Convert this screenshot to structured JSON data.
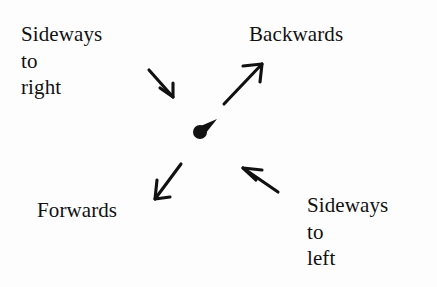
{
  "figure": {
    "caption_present": false,
    "background_color": "#fdfdfd",
    "ink_color": "#111111",
    "labels": {
      "top_left": "Sideways\nto\nright",
      "top_right": "Backwards",
      "bottom_left": "Forwards",
      "bottom_right": "Sideways\nto\nleft"
    },
    "center_marker": {
      "name": "center-dot-marker",
      "dot_x": 200,
      "dot_y": 132,
      "dot_radius": 7,
      "tail_end_x": 217,
      "tail_end_y": 119
    },
    "arrows": [
      {
        "name": "arrow-sideways-to-right",
        "direction": "down-right toward center",
        "points_to": "Sideways to right",
        "x1": 149,
        "y1": 70,
        "x2": 173,
        "y2": 97,
        "head_at": "end",
        "barb1_x": 160,
        "barb1_y": 88,
        "barb2_x": 173,
        "barb2_y": 83
      },
      {
        "name": "arrow-backwards",
        "direction": "up-right",
        "points_to": "Backwards",
        "x1": 224,
        "y1": 104,
        "x2": 262,
        "y2": 64,
        "head_at": "end",
        "barb1_x": 243,
        "barb1_y": 66,
        "barb2_x": 260,
        "barb2_y": 82
      },
      {
        "name": "arrow-forwards",
        "direction": "down-left",
        "points_to": "Forwards",
        "x1": 181,
        "y1": 164,
        "x2": 155,
        "y2": 199,
        "head_at": "end",
        "barb1_x": 157,
        "barb1_y": 180,
        "barb2_x": 170,
        "barb2_y": 197
      },
      {
        "name": "arrow-sideways-to-left",
        "direction": "up-left toward center",
        "points_to": "Sideways to left",
        "x1": 278,
        "y1": 192,
        "x2": 243,
        "y2": 168,
        "head_at": "end",
        "barb1_x": 262,
        "barb1_y": 170,
        "barb2_x": 256,
        "barb2_y": 180
      }
    ]
  }
}
